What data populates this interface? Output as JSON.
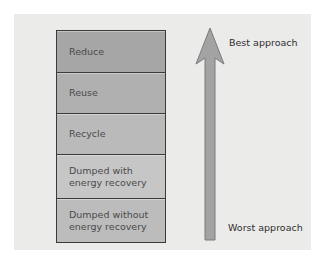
{
  "diagram": {
    "levels": [
      {
        "label": "Reduce",
        "color": "#a6a6a6",
        "height": 41
      },
      {
        "label": "Reuse",
        "color": "#b0b0b0",
        "height": 41
      },
      {
        "label": "Recycle",
        "color": "#bababa",
        "height": 41
      },
      {
        "label": "Dumped with energy recovery",
        "color": "#c6c6c6",
        "height": 44
      },
      {
        "label": "Dumped without energy recovery",
        "color": "#bcbcbc",
        "height": 44
      }
    ],
    "arrow": {
      "direction": "up",
      "color": "#a3a3a3",
      "stroke": "#7a7a7a",
      "top_label": "Best approach",
      "bottom_label": "Worst approach"
    },
    "colors": {
      "panel_background": "#ebebea",
      "box_border": "#3a3a3a",
      "text": "#4a4a4a"
    }
  }
}
